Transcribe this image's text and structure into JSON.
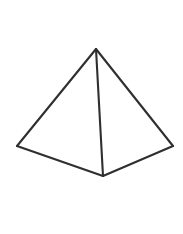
{
  "figure": {
    "name": "square-pyramid",
    "canvas": {
      "width": 183,
      "height": 234,
      "background": "#ffffff"
    },
    "style": {
      "visible_edge_color": "#2f2f2f",
      "visible_edge_width": 2.1,
      "hidden_edge_color": "#4a4a4a",
      "hidden_edge_width": 1.3,
      "hidden_edge_dash": "4 3.2",
      "face_fill": "#ffffff"
    },
    "vertices": [
      {
        "id": "apex",
        "label": "Apex",
        "x": 96,
        "y": 49,
        "hidden": false
      },
      {
        "id": "base-left",
        "label": "Base Left",
        "x": 17,
        "y": 146,
        "hidden": false
      },
      {
        "id": "base-front",
        "label": "Base Front",
        "x": 103,
        "y": 176,
        "hidden": false
      },
      {
        "id": "base-right",
        "label": "Base Right",
        "x": 173,
        "y": 146,
        "hidden": false
      },
      {
        "id": "base-back",
        "label": "Base Back (hidden)",
        "x": 88,
        "y": 118,
        "hidden": true
      }
    ],
    "edges": [
      {
        "id": "apex-to-left",
        "from": "apex",
        "to": "base-left",
        "style": "solid",
        "path": "M 96 49 L 17 146"
      },
      {
        "id": "apex-to-right",
        "from": "apex",
        "to": "base-right",
        "style": "solid",
        "path": "M 96 49 L 173 146"
      },
      {
        "id": "apex-to-front",
        "from": "apex",
        "to": "base-front",
        "style": "solid",
        "path": "M 96 49 L 103 176"
      },
      {
        "id": "left-to-front",
        "from": "base-left",
        "to": "base-front",
        "style": "solid",
        "path": "M 17 146 L 103 176"
      },
      {
        "id": "front-to-right",
        "from": "base-front",
        "to": "base-right",
        "style": "solid",
        "path": "M 103 176 L 173 146"
      },
      {
        "id": "apex-to-back",
        "from": "apex",
        "to": "base-back",
        "style": "dashed",
        "path": "M 96 49 L 88 118"
      },
      {
        "id": "left-to-back",
        "from": "base-left",
        "to": "base-back",
        "style": "dashed",
        "path": "M 17 146 L 88 118"
      },
      {
        "id": "back-to-right",
        "from": "base-back",
        "to": "base-right",
        "style": "dashed",
        "path": "M 88 118 L 173 146"
      }
    ],
    "faces": [
      {
        "id": "face-left",
        "label": "Left Visible Face",
        "points": "96,49 17,146 103,176"
      },
      {
        "id": "face-right",
        "label": "Right Visible Face",
        "points": "96,49 103,176 173,146"
      }
    ]
  }
}
